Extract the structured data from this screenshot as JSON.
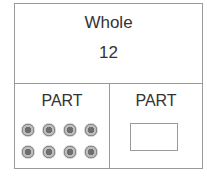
{
  "diagram": {
    "type": "part-part-whole",
    "whole": {
      "label": "Whole",
      "value": "12"
    },
    "parts": [
      {
        "label": "PART",
        "counters": 8,
        "content": "counters"
      },
      {
        "label": "PART",
        "content": "empty-answer-box",
        "value": ""
      }
    ],
    "colors": {
      "border": "#9a9a9a",
      "counter": "#8a8a8a",
      "text": "#333333"
    }
  }
}
